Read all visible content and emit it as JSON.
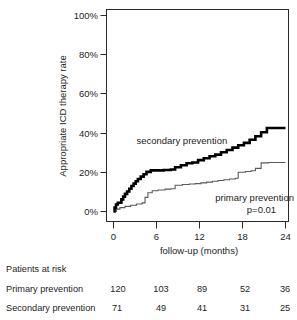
{
  "chart_data": {
    "type": "line",
    "title": "",
    "xlabel": "follow-up (months)",
    "ylabel": "Appropriate ICD therapy rate",
    "xlim": [
      0,
      24
    ],
    "ylim": [
      0,
      100
    ],
    "xticks": [
      "0",
      "6",
      "12",
      "18",
      "24"
    ],
    "xtick_values": [
      0,
      6,
      12,
      18,
      24
    ],
    "yticks": [
      "0%",
      "20%",
      "40%",
      "60%",
      "80%",
      "100%"
    ],
    "ytick_values": [
      0,
      20,
      40,
      60,
      80,
      100
    ],
    "grid": false,
    "legend_position": "inline-annotations",
    "annotations": [
      {
        "text": "secondary prevention",
        "x": 3.2,
        "y": 36
      },
      {
        "text": "primary prevention",
        "x": 14.2,
        "y": 7
      },
      {
        "text": "p=0.01",
        "x": 18.6,
        "y": 1
      }
    ],
    "series": [
      {
        "name": "secondary prevention",
        "style": "step",
        "color": "#000000",
        "line_width": 2.6,
        "points": [
          [
            0.0,
            0.0
          ],
          [
            0.15,
            2.0
          ],
          [
            0.35,
            3.6
          ],
          [
            0.6,
            4.5
          ],
          [
            0.9,
            4.5
          ],
          [
            1.1,
            6.2
          ],
          [
            1.35,
            7.6
          ],
          [
            1.6,
            9.0
          ],
          [
            1.9,
            10.2
          ],
          [
            2.2,
            11.6
          ],
          [
            2.5,
            13.0
          ],
          [
            2.8,
            14.2
          ],
          [
            3.1,
            15.4
          ],
          [
            3.4,
            16.6
          ],
          [
            3.8,
            17.8
          ],
          [
            4.2,
            19.0
          ],
          [
            4.6,
            20.2
          ],
          [
            5.2,
            21.0
          ],
          [
            6.0,
            21.0
          ],
          [
            7.0,
            21.2
          ],
          [
            8.0,
            21.4
          ],
          [
            8.6,
            22.6
          ],
          [
            9.4,
            23.6
          ],
          [
            10.2,
            24.6
          ],
          [
            11.0,
            25.0
          ],
          [
            11.8,
            26.2
          ],
          [
            12.6,
            27.2
          ],
          [
            13.4,
            28.2
          ],
          [
            14.2,
            29.0
          ],
          [
            15.0,
            30.2
          ],
          [
            15.8,
            31.4
          ],
          [
            16.6,
            32.6
          ],
          [
            17.4,
            33.8
          ],
          [
            18.2,
            35.0
          ],
          [
            19.0,
            36.6
          ],
          [
            19.8,
            38.4
          ],
          [
            20.6,
            40.4
          ],
          [
            21.4,
            42.6
          ],
          [
            24.0,
            42.6
          ]
        ]
      },
      {
        "name": "primary prevention",
        "style": "step",
        "color": "#5a5a5a",
        "line_width": 1.1,
        "points": [
          [
            0.0,
            0.0
          ],
          [
            0.4,
            1.2
          ],
          [
            0.9,
            2.0
          ],
          [
            1.6,
            2.6
          ],
          [
            2.4,
            3.2
          ],
          [
            3.2,
            3.8
          ],
          [
            4.0,
            4.4
          ],
          [
            4.4,
            7.2
          ],
          [
            4.8,
            9.6
          ],
          [
            5.4,
            10.6
          ],
          [
            6.2,
            11.0
          ],
          [
            7.2,
            11.4
          ],
          [
            8.0,
            11.6
          ],
          [
            8.6,
            13.4
          ],
          [
            9.6,
            13.8
          ],
          [
            10.6,
            14.0
          ],
          [
            11.4,
            14.2
          ],
          [
            12.2,
            14.6
          ],
          [
            13.0,
            15.0
          ],
          [
            13.8,
            15.4
          ],
          [
            14.6,
            15.8
          ],
          [
            15.4,
            16.2
          ],
          [
            16.2,
            16.6
          ],
          [
            17.0,
            17.0
          ],
          [
            17.4,
            20.0
          ],
          [
            18.4,
            20.4
          ],
          [
            19.2,
            20.8
          ],
          [
            19.8,
            22.0
          ],
          [
            20.6,
            24.8
          ],
          [
            21.6,
            25.0
          ],
          [
            24.0,
            25.0
          ]
        ]
      }
    ]
  },
  "risk_table": {
    "title": "Patients at risk",
    "rows": [
      {
        "label": "Primary prevention",
        "values": [
          "120",
          "103",
          "89",
          "52",
          "36"
        ]
      },
      {
        "label": "Secondary prevention",
        "values": [
          "71",
          "49",
          "41",
          "31",
          "25"
        ]
      }
    ]
  }
}
